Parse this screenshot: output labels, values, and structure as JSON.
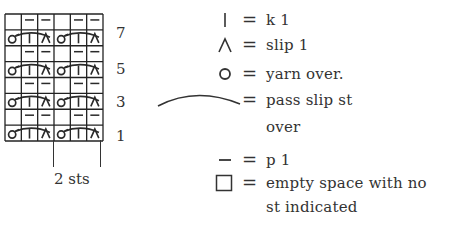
{
  "chart": {
    "title": "",
    "columns": 6,
    "rows": 8,
    "repeat_label": "2 sts",
    "row_labels": [
      {
        "label": "7",
        "row": 7
      },
      {
        "label": "5",
        "row": 5
      },
      {
        "label": "3",
        "row": 3
      },
      {
        "label": "1",
        "row": 1
      }
    ],
    "odd_row_pattern": [
      "yo",
      "k1",
      "slip",
      "yo",
      "k1",
      "slip"
    ],
    "even_row_pattern": [
      "empty",
      "p1",
      "p1",
      "empty",
      "p1",
      "p1"
    ],
    "grid_rows_top_to_bottom": [
      [
        "empty",
        "p1",
        "p1",
        "empty",
        "p1",
        "p1"
      ],
      [
        "yo",
        "k1",
        "slip",
        "yo",
        "k1",
        "slip"
      ],
      [
        "empty",
        "p1",
        "p1",
        "empty",
        "p1",
        "p1"
      ],
      [
        "yo",
        "k1",
        "slip",
        "yo",
        "k1",
        "slip"
      ],
      [
        "empty",
        "p1",
        "p1",
        "empty",
        "p1",
        "p1"
      ],
      [
        "yo",
        "k1",
        "slip",
        "yo",
        "k1",
        "slip"
      ],
      [
        "empty",
        "p1",
        "p1",
        "empty",
        "p1",
        "p1"
      ],
      [
        "yo",
        "k1",
        "slip",
        "yo",
        "k1",
        "slip"
      ]
    ]
  },
  "legend": {
    "equals": "=",
    "items": [
      {
        "symbol": "k1-icon",
        "text": "k 1"
      },
      {
        "symbol": "slip-icon",
        "text": "slip 1"
      },
      {
        "symbol": "yarn-over-icon",
        "text": "yarn over."
      },
      {
        "symbol": "pass-slip-arc-icon",
        "text": "pass slip st",
        "text_line2": "over"
      },
      {
        "symbol": "purl-icon",
        "text": "p 1"
      },
      {
        "symbol": "empty-square-icon",
        "text": "empty space with no",
        "text_line2": "st indicated"
      }
    ]
  },
  "colors": {
    "ink": "#2a2a2a",
    "background": "#ffffff"
  }
}
